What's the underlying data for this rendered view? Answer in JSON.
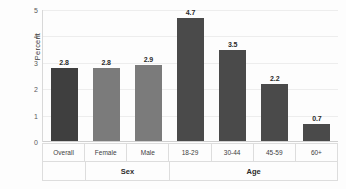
{
  "chart_data": {
    "type": "bar",
    "title": "",
    "xlabel": "",
    "ylabel": "Percent",
    "ylim": [
      0,
      5
    ],
    "yticks": [
      "0",
      "1",
      "2",
      "3",
      "4",
      "5"
    ],
    "grid": true,
    "legend": "none",
    "categories": [
      "Overall",
      "Female",
      "Male",
      "18-29",
      "30-44",
      "45-59",
      "60+"
    ],
    "values": [
      2.8,
      2.8,
      2.9,
      4.7,
      3.5,
      2.2,
      0.7
    ],
    "value_labels": [
      "2.8",
      "2.8",
      "2.9",
      "4.7",
      "3.5",
      "2.2",
      "0.7"
    ],
    "bar_colors": [
      "#3f3f3f",
      "#7b7b7b",
      "#7b7b7b",
      "#4a4a4a",
      "#4a4a4a",
      "#4a4a4a",
      "#4a4a4a"
    ],
    "groups": [
      {
        "label": "",
        "span": 1
      },
      {
        "label": "Sex",
        "span": 2
      },
      {
        "label": "Age",
        "span": 4
      }
    ]
  },
  "axis": {
    "y_title": "Percent"
  }
}
